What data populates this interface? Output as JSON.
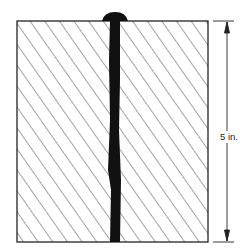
{
  "diagram": {
    "dimension": {
      "label": "5 in.",
      "direction": "vertical"
    },
    "parts": [
      "hatched-plate-left",
      "hatched-plate-right",
      "weld-bead",
      "dimension-line"
    ],
    "colors": {
      "ink": "#111111",
      "background": "#ffffff"
    }
  }
}
